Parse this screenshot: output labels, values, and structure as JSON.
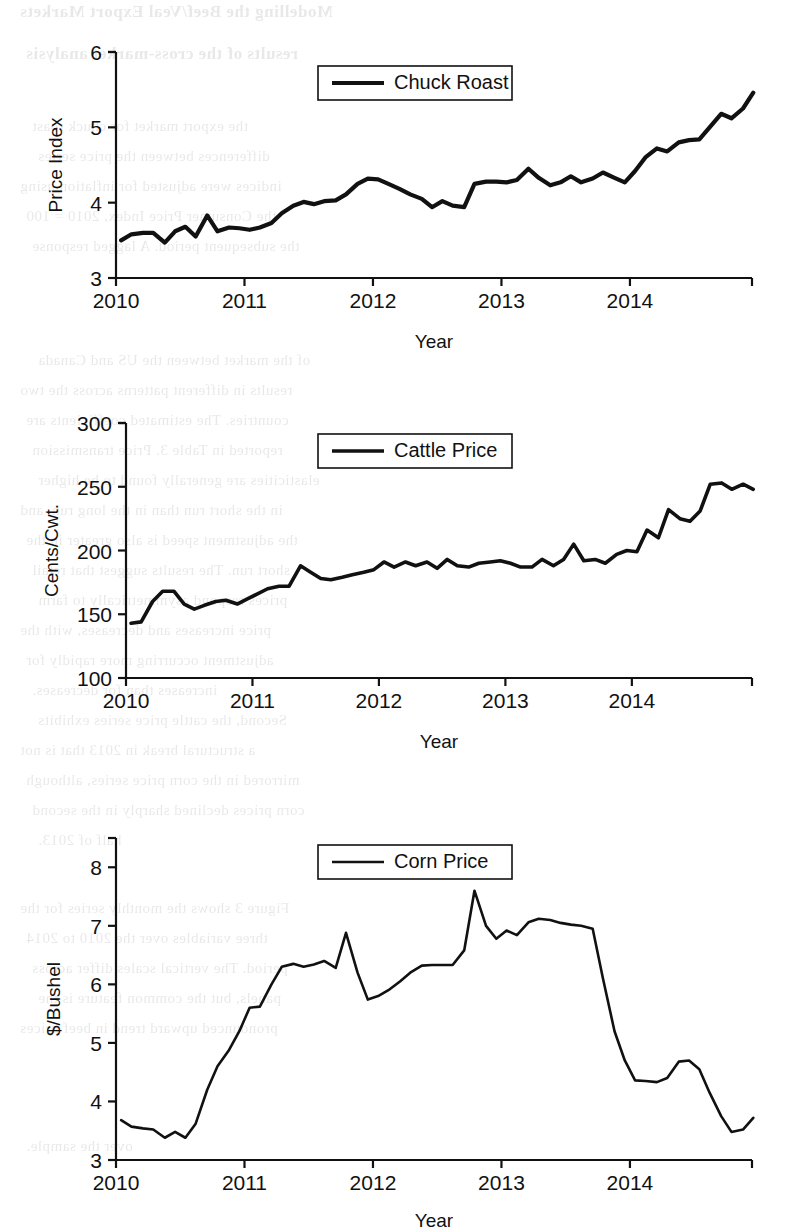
{
  "page": {
    "background_color": "#ffffff",
    "ink_color": "#111111",
    "bleed_through_lines": [
      "Modelling the Beef/Veal Export Markets",
      "results of the cross-market analysis",
      "the export market for chuck roast",
      "differences between the price series",
      "indices were adjusted for inflation using",
      "the Consumer Price Index, 2010 = 100",
      "the subsequent period. A lagged response",
      "of the market between the US and Canada",
      "results in different patterns across the two",
      "countries. The estimated coefficients are",
      "reported in Table 3. Price transmission",
      "elasticities are generally found to be higher",
      "in the short run than in the long run, and",
      "the adjustment speed is also greater in the",
      "short run. The results suggest that retail",
      "prices respond asymmetrically to farm",
      "price increases and decreases, with the",
      "adjustment occurring more rapidly for",
      "increases than for decreases.",
      "Second, the cattle price series exhibits",
      "a structural break in 2013 that is not",
      "mirrored in the corn price series, although",
      "corn prices declined sharply in the second",
      "half of 2013.",
      "Figure 3 shows the monthly series for the",
      "three variables over the 2010 to 2014",
      "period. The vertical scales differ across",
      "panels, but the common feature is the",
      "pronounced upward trend in beef prices",
      "over the sample."
    ]
  },
  "figures": [
    {
      "id": "chuck-roast",
      "name": "chuck-roast-chart",
      "legend_label": "Chuck Roast",
      "x_axis_title": "Year",
      "y_axis_title": "Price Index",
      "y_ticks": [
        "3",
        "4",
        "5",
        "6"
      ],
      "x_ticks": [
        "2010",
        "2011",
        "2012",
        "2013",
        "2014"
      ]
    },
    {
      "id": "cattle-price",
      "name": "cattle-price-chart",
      "legend_label": "Cattle Price",
      "x_axis_title": "Year",
      "y_axis_title": "Cents/Cwt.",
      "y_ticks": [
        "100",
        "150",
        "200",
        "250",
        "300"
      ],
      "x_ticks": [
        "2010",
        "2011",
        "2012",
        "2013",
        "2014"
      ]
    },
    {
      "id": "corn-price",
      "name": "corn-price-chart",
      "legend_label": "Corn Price",
      "x_axis_title": "Year",
      "y_axis_title": "$/Bushel",
      "y_ticks": [
        "3",
        "4",
        "5",
        "6",
        "7",
        "8"
      ],
      "x_ticks": [
        "2010",
        "2011",
        "2012",
        "2013",
        "2014"
      ]
    }
  ],
  "chart_data": [
    {
      "type": "line",
      "title": "Chuck Roast",
      "xlabel": "Year",
      "ylabel": "Price Index",
      "xlim": [
        2010.0,
        2014.95
      ],
      "ylim": [
        3,
        6
      ],
      "yticks": [
        3,
        4,
        5,
        6
      ],
      "xticks": [
        2010,
        2011,
        2012,
        2013,
        2014
      ],
      "grid": false,
      "legend_position": "top-center",
      "series": [
        {
          "name": "Chuck Roast",
          "color": "#111111",
          "x": [
            2010.04,
            2010.12,
            2010.21,
            2010.29,
            2010.38,
            2010.46,
            2010.54,
            2010.62,
            2010.71,
            2010.79,
            2010.88,
            2010.96,
            2011.04,
            2011.12,
            2011.21,
            2011.29,
            2011.38,
            2011.46,
            2011.54,
            2011.62,
            2011.71,
            2011.79,
            2011.88,
            2011.96,
            2012.04,
            2012.12,
            2012.21,
            2012.29,
            2012.38,
            2012.46,
            2012.54,
            2012.62,
            2012.71,
            2012.79,
            2012.88,
            2012.96,
            2013.04,
            2013.12,
            2013.21,
            2013.29,
            2013.38,
            2013.46,
            2013.54,
            2013.62,
            2013.71,
            2013.79,
            2013.88,
            2013.96,
            2014.04,
            2014.12,
            2014.21,
            2014.29,
            2014.38,
            2014.46,
            2014.54,
            2014.62,
            2014.71,
            2014.79,
            2014.88,
            2014.96
          ],
          "values": [
            3.5,
            3.58,
            3.6,
            3.6,
            3.47,
            3.62,
            3.68,
            3.55,
            3.83,
            3.62,
            3.67,
            3.66,
            3.64,
            3.67,
            3.73,
            3.86,
            3.96,
            4.01,
            3.98,
            4.02,
            4.03,
            4.11,
            4.25,
            4.32,
            4.31,
            4.25,
            4.18,
            4.11,
            4.05,
            3.94,
            4.02,
            3.96,
            3.94,
            4.25,
            4.28,
            4.28,
            4.27,
            4.3,
            4.45,
            4.33,
            4.23,
            4.27,
            4.35,
            4.27,
            4.32,
            4.4,
            4.33,
            4.27,
            4.42,
            4.6,
            4.72,
            4.68,
            4.8,
            4.83,
            4.84,
            5.0,
            5.18,
            5.12,
            5.25,
            5.46
          ]
        }
      ]
    },
    {
      "type": "line",
      "title": "Cattle Price",
      "xlabel": "Year",
      "ylabel": "Cents/Cwt.",
      "xlim": [
        2010.0,
        2014.95
      ],
      "ylim": [
        100,
        300
      ],
      "yticks": [
        100,
        150,
        200,
        250,
        300
      ],
      "xticks": [
        2010,
        2011,
        2012,
        2013,
        2014
      ],
      "grid": false,
      "legend_position": "top-center",
      "series": [
        {
          "name": "Cattle Price",
          "color": "#111111",
          "x": [
            2010.04,
            2010.12,
            2010.21,
            2010.29,
            2010.38,
            2010.46,
            2010.54,
            2010.62,
            2010.71,
            2010.79,
            2010.88,
            2010.96,
            2011.04,
            2011.12,
            2011.21,
            2011.29,
            2011.38,
            2011.46,
            2011.54,
            2011.62,
            2011.71,
            2011.79,
            2011.88,
            2011.96,
            2012.04,
            2012.12,
            2012.21,
            2012.29,
            2012.38,
            2012.46,
            2012.54,
            2012.62,
            2012.71,
            2012.79,
            2012.88,
            2012.96,
            2013.04,
            2013.12,
            2013.21,
            2013.29,
            2013.38,
            2013.46,
            2013.54,
            2013.62,
            2013.71,
            2013.79,
            2013.88,
            2013.96,
            2014.04,
            2014.12,
            2014.21,
            2014.29,
            2014.38,
            2014.46,
            2014.54,
            2014.62,
            2014.71,
            2014.79,
            2014.88,
            2014.96
          ],
          "values": [
            143,
            144,
            160,
            168,
            168,
            158,
            154,
            157,
            160,
            161,
            158,
            162,
            166,
            170,
            172,
            172,
            188,
            183,
            178,
            177,
            179,
            181,
            183,
            185,
            191,
            187,
            191,
            188,
            191,
            186,
            193,
            188,
            187,
            190,
            191,
            192,
            190,
            187,
            187,
            193,
            188,
            193,
            205,
            192,
            193,
            190,
            197,
            200,
            199,
            216,
            210,
            232,
            225,
            223,
            231,
            252,
            253,
            248,
            252,
            248
          ]
        }
      ]
    },
    {
      "type": "line",
      "title": "Corn Price",
      "xlabel": "Year",
      "ylabel": "$/Bushel",
      "xlim": [
        2010.0,
        2014.95
      ],
      "ylim": [
        3,
        8.5
      ],
      "yticks": [
        3,
        4,
        5,
        6,
        7,
        8
      ],
      "xticks": [
        2010,
        2011,
        2012,
        2013,
        2014
      ],
      "grid": false,
      "legend_position": "top-center",
      "series": [
        {
          "name": "Corn Price",
          "color": "#111111",
          "x": [
            2010.04,
            2010.12,
            2010.21,
            2010.29,
            2010.38,
            2010.46,
            2010.54,
            2010.62,
            2010.71,
            2010.79,
            2010.88,
            2010.96,
            2011.04,
            2011.12,
            2011.21,
            2011.29,
            2011.38,
            2011.46,
            2011.54,
            2011.62,
            2011.71,
            2011.79,
            2011.88,
            2011.96,
            2012.04,
            2012.12,
            2012.21,
            2012.29,
            2012.38,
            2012.46,
            2012.54,
            2012.62,
            2012.71,
            2012.79,
            2012.88,
            2012.96,
            2013.04,
            2013.12,
            2013.21,
            2013.29,
            2013.38,
            2013.46,
            2013.54,
            2013.62,
            2013.71,
            2013.79,
            2013.88,
            2013.96,
            2014.04,
            2014.12,
            2014.21,
            2014.29,
            2014.38,
            2014.46,
            2014.54,
            2014.62,
            2014.71,
            2014.79,
            2014.88,
            2014.96
          ],
          "values": [
            3.68,
            3.57,
            3.54,
            3.52,
            3.38,
            3.48,
            3.38,
            3.62,
            4.2,
            4.6,
            4.88,
            5.2,
            5.6,
            5.62,
            6.0,
            6.3,
            6.35,
            6.3,
            6.34,
            6.4,
            6.28,
            6.88,
            6.2,
            5.74,
            5.8,
            5.9,
            6.05,
            6.2,
            6.32,
            6.33,
            6.33,
            6.33,
            6.58,
            7.6,
            7.0,
            6.78,
            6.92,
            6.84,
            7.06,
            7.12,
            7.1,
            7.05,
            7.02,
            7.0,
            6.95,
            6.1,
            5.2,
            4.7,
            4.36,
            4.35,
            4.33,
            4.4,
            4.68,
            4.7,
            4.55,
            4.15,
            3.75,
            3.48,
            3.52,
            3.72
          ]
        }
      ]
    }
  ]
}
